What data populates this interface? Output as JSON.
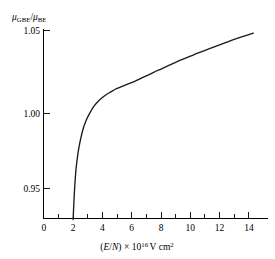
{
  "figure": {
    "background": "#ffffff",
    "curve_color": "#1a1a1a",
    "axis_color": "#000000"
  },
  "yaxis": {
    "label_main": "μ",
    "label_sub1": "GBE",
    "label_slash": "/",
    "label_main2": "μ",
    "label_sub2": "BE",
    "label_full": "μ_GBE / μ_BE",
    "ticks": [
      "1.05",
      "1.00",
      "0.95"
    ],
    "tick_values": [
      1.05,
      1.0,
      0.95
    ],
    "min_shown": 0.93,
    "max_shown": 1.053
  },
  "xaxis": {
    "label_paren_open": "(",
    "label_E": "E",
    "label_slash": "/",
    "label_N": "N",
    "label_paren_close": ")",
    "label_times": "×",
    "label_ten": "10",
    "label_exp": "16",
    "label_units": "V cm",
    "label_units_exp": "2",
    "label_full": "(E/N) × 10^16 V cm^2",
    "major_ticks": [
      "0",
      "2",
      "4",
      "6",
      "8",
      "10",
      "12",
      "14"
    ],
    "major_tick_values": [
      0,
      2,
      4,
      6,
      8,
      10,
      12,
      14
    ],
    "minor_tick_values": [
      1,
      3,
      5,
      7,
      9,
      11,
      13
    ],
    "min": 0,
    "max": 14.3
  },
  "chart_data": {
    "type": "line",
    "title": "",
    "xlabel": "(E/N) × 10^16 V cm^2",
    "ylabel": "μ_GBE / μ_BE",
    "xlim": [
      0,
      14.3
    ],
    "ylim": [
      0.93,
      1.053
    ],
    "grid": false,
    "legend": null,
    "series": [
      {
        "name": "μ_GBE/μ_BE vs E/N",
        "x": [
          2.0,
          2.05,
          2.1,
          2.2,
          2.35,
          2.5,
          2.7,
          2.9,
          3.1,
          3.4,
          3.7,
          4.0,
          4.3,
          4.6,
          5.0,
          5.4,
          5.8,
          6.2,
          6.6,
          7.0,
          7.5,
          8.0,
          8.5,
          9.0,
          9.5,
          10.0,
          10.5,
          11.0,
          11.5,
          12.0,
          12.5,
          13.0,
          13.5,
          14.0,
          14.3
        ],
        "y": [
          0.93,
          0.94,
          0.949,
          0.962,
          0.973,
          0.9805,
          0.988,
          0.993,
          0.9968,
          1.0015,
          1.0048,
          1.0073,
          1.0093,
          1.011,
          1.013,
          1.0145,
          1.016,
          1.0175,
          1.0192,
          1.021,
          1.0232,
          1.0253,
          1.0274,
          1.0295,
          1.0315,
          1.0334,
          1.0353,
          1.0371,
          1.0389,
          1.0406,
          1.0423,
          1.044,
          1.0456,
          1.0471,
          1.048
        ]
      }
    ]
  }
}
